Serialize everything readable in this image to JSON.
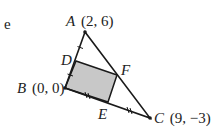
{
  "margin_char": "e",
  "diagram": {
    "type": "triangle-with-inscribed-rectangle",
    "points": {
      "A": {
        "label": "A",
        "coords": "(2, 6)"
      },
      "B": {
        "label": "B",
        "coords": "(0, 0)"
      },
      "C": {
        "label": "C",
        "coords": "(9, −3)"
      },
      "D": {
        "label": "D"
      },
      "E": {
        "label": "E"
      },
      "F": {
        "label": "F"
      }
    },
    "colors": {
      "line": "#1a1a1a",
      "shade": "#c8c8c8"
    }
  }
}
